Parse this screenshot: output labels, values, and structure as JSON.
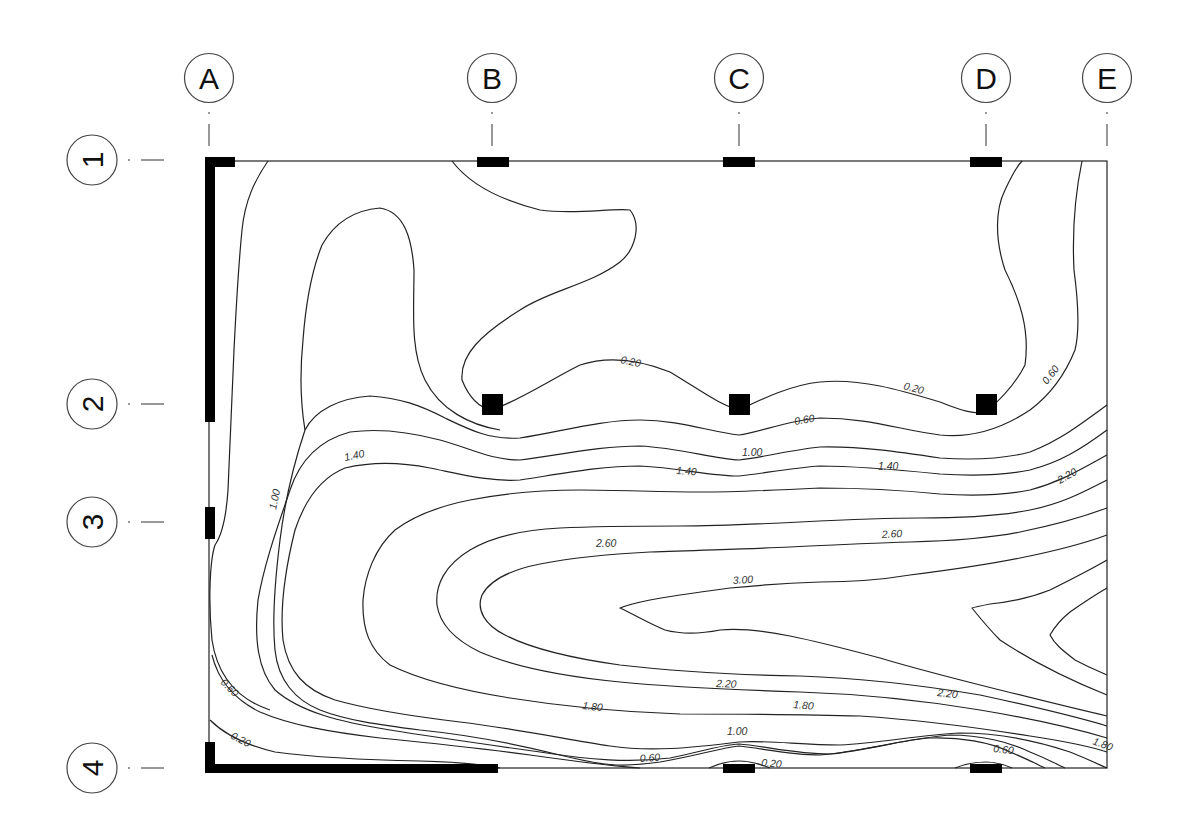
{
  "grid": {
    "columns": [
      {
        "label": "A",
        "x": 209
      },
      {
        "label": "B",
        "x": 492
      },
      {
        "label": "C",
        "x": 739
      },
      {
        "label": "D",
        "x": 986
      },
      {
        "label": "E",
        "x": 1107
      }
    ],
    "rows": [
      {
        "label": "1",
        "y": 160
      },
      {
        "label": "2",
        "y": 404
      },
      {
        "label": "3",
        "y": 522
      },
      {
        "label": "4",
        "y": 768
      }
    ]
  },
  "contour_levels": [
    "0.20",
    "0.60",
    "1.00",
    "1.40",
    "1.80",
    "2.20",
    "2.60",
    "3.00"
  ],
  "contour_labels": [
    {
      "text": "0.20",
      "x": 620,
      "y": 363,
      "rot": 12
    },
    {
      "text": "0.20",
      "x": 903,
      "y": 389,
      "rot": 15
    },
    {
      "text": "0.60",
      "x": 1047,
      "y": 385,
      "rot": -52
    },
    {
      "text": "0.60",
      "x": 795,
      "y": 425,
      "rot": -10
    },
    {
      "text": "1.00",
      "x": 742,
      "y": 456,
      "rot": 0
    },
    {
      "text": "1.40",
      "x": 676,
      "y": 474,
      "rot": 4
    },
    {
      "text": "1.40",
      "x": 878,
      "y": 470,
      "rot": 0
    },
    {
      "text": "1.40",
      "x": 345,
      "y": 461,
      "rot": -12
    },
    {
      "text": "1.00",
      "x": 276,
      "y": 510,
      "rot": -78
    },
    {
      "text": "2.20",
      "x": 1060,
      "y": 484,
      "rot": -30
    },
    {
      "text": "2.60",
      "x": 596,
      "y": 547,
      "rot": 0
    },
    {
      "text": "2.60",
      "x": 882,
      "y": 538,
      "rot": -3
    },
    {
      "text": "3.00",
      "x": 733,
      "y": 584,
      "rot": -4
    },
    {
      "text": "2.20",
      "x": 716,
      "y": 687,
      "rot": 2
    },
    {
      "text": "2.20",
      "x": 937,
      "y": 696,
      "rot": 6
    },
    {
      "text": "1.80",
      "x": 582,
      "y": 709,
      "rot": 6
    },
    {
      "text": "1.80",
      "x": 793,
      "y": 708,
      "rot": 5
    },
    {
      "text": "1.00",
      "x": 727,
      "y": 735,
      "rot": 0
    },
    {
      "text": "1.80",
      "x": 1092,
      "y": 744,
      "rot": 20
    },
    {
      "text": "0.60",
      "x": 993,
      "y": 752,
      "rot": 6
    },
    {
      "text": "0.60",
      "x": 640,
      "y": 762,
      "rot": -4
    },
    {
      "text": "0.20",
      "x": 761,
      "y": 766,
      "rot": 5
    },
    {
      "text": "0.60",
      "x": 220,
      "y": 683,
      "rot": 45
    },
    {
      "text": "0.20",
      "x": 230,
      "y": 738,
      "rot": 28
    }
  ]
}
